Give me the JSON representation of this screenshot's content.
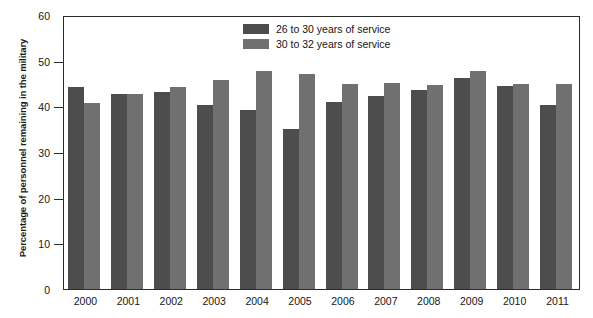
{
  "chart_data": {
    "type": "bar",
    "title": "",
    "xlabel": "",
    "ylabel": "Percentage of personnel remaining in the military",
    "ylim": [
      0,
      60
    ],
    "yticks": [
      0,
      10,
      20,
      30,
      40,
      50,
      60
    ],
    "grid": false,
    "legend_position": "top-center",
    "categories": [
      "2000",
      "2001",
      "2002",
      "2003",
      "2004",
      "2005",
      "2006",
      "2007",
      "2008",
      "2009",
      "2010",
      "2011"
    ],
    "series": [
      {
        "name": "26 to 30 years of service",
        "color": "#4d4d4d",
        "values": [
          44.5,
          43.0,
          43.4,
          40.6,
          39.5,
          35.2,
          41.2,
          42.5,
          43.8,
          46.5,
          44.7,
          40.7
        ]
      },
      {
        "name": "30 to 32 years of service",
        "color": "#707070",
        "values": [
          41.0,
          43.0,
          44.5,
          46.0,
          48.0,
          47.5,
          45.2,
          45.5,
          45.0,
          48.0,
          45.2,
          45.3
        ]
      }
    ]
  }
}
